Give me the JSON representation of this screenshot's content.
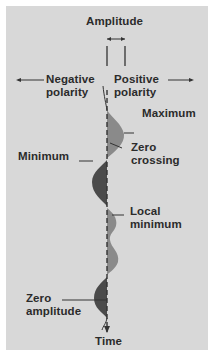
{
  "diagram": {
    "labels": {
      "amplitude": "Amplitude",
      "negative_polarity_line1": "Negative",
      "negative_polarity_line2": "polarity",
      "positive_polarity_line1": "Positive",
      "positive_polarity_line2": "polarity",
      "maximum": "Maximum",
      "zero_crossing_line1": "Zero",
      "zero_crossing_line2": "crossing",
      "minimum": "Minimum",
      "local_minimum_line1": "Local",
      "local_minimum_line2": "minimum",
      "zero_amplitude_line1": "Zero",
      "zero_amplitude_line2": "amplitude",
      "time": "Time"
    },
    "colors": {
      "background": "#d8d8d8",
      "text": "#2b2b2b",
      "positive_fill": "#8a8a8a",
      "negative_fill": "#4a4a4a",
      "axis": "#333333"
    }
  }
}
